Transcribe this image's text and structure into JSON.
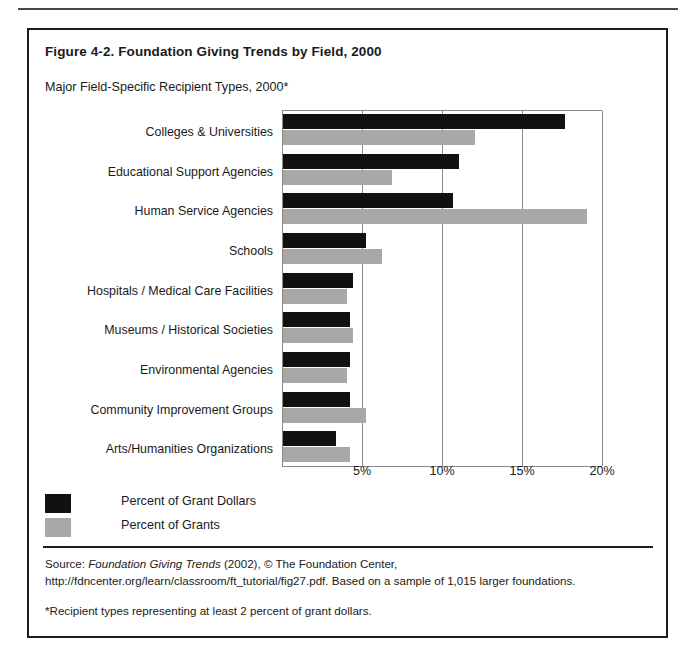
{
  "figure": {
    "title": "Figure 4-2. Foundation Giving Trends by Field, 2000",
    "subtitle": "Major Field-Specific Recipient Types, 2000*"
  },
  "legend": {
    "items": [
      {
        "label": "Percent of Grant Dollars",
        "color": "#111111"
      },
      {
        "label": "Percent of Grants",
        "color": "#a8a8a8"
      }
    ]
  },
  "source": {
    "prefix": "Source: ",
    "italic_title": "Foundation Giving Trends",
    "rest": " (2002), © The Foundation Center, http://fdncenter.org/learn/classroom/ft_tutorial/fig27.pdf. Based on a sample of 1,015 larger foundations.",
    "footnote": "*Recipient types representing at least 2 percent of grant dollars."
  },
  "chart_data": {
    "type": "bar",
    "orientation": "horizontal",
    "title": "Major Field-Specific Recipient Types, 2000*",
    "xlabel": "",
    "ylabel": "",
    "xlim": [
      0,
      20
    ],
    "xticks": [
      5,
      10,
      15,
      20
    ],
    "xtick_labels": [
      "5%",
      "10%",
      "15%",
      "20%"
    ],
    "grid": true,
    "legend_position": "below-left",
    "categories": [
      "Colleges & Universities",
      "Educational Support Agencies",
      "Human Service Agencies",
      "Schools",
      "Hospitals / Medical Care Facilities",
      "Museums / Historical Societies",
      "Environmental Agencies",
      "Community Improvement Groups",
      "Arts/Humanities Organizations"
    ],
    "series": [
      {
        "name": "Percent of Grant Dollars",
        "color": "#111111",
        "values": [
          17.6,
          11.0,
          10.6,
          5.2,
          4.4,
          4.2,
          4.2,
          4.2,
          3.3
        ]
      },
      {
        "name": "Percent of Grants",
        "color": "#a8a8a8",
        "values": [
          12.0,
          6.8,
          19.0,
          6.2,
          4.0,
          4.4,
          4.0,
          5.2,
          4.2
        ]
      }
    ]
  }
}
